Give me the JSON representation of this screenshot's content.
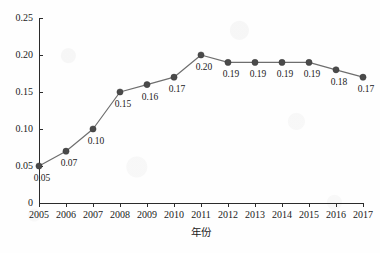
{
  "chart_data": {
    "type": "line",
    "title": "",
    "xlabel": "年份",
    "ylabel": "",
    "categories": [
      "2005",
      "2006",
      "2007",
      "2008",
      "2009",
      "2010",
      "2011",
      "2012",
      "2013",
      "2014",
      "2015",
      "2016",
      "2017"
    ],
    "values": [
      0.05,
      0.07,
      0.1,
      0.15,
      0.16,
      0.17,
      0.2,
      0.19,
      0.19,
      0.19,
      0.19,
      0.18,
      0.17
    ],
    "point_labels": [
      "0.05",
      "0.07",
      "0.10",
      "0.15",
      "0.16",
      "0.17",
      "0.20",
      "0.19",
      "0.19",
      "0.19",
      "0.19",
      "0.18",
      "0.17"
    ],
    "ylim": [
      0,
      0.25
    ],
    "yticks": [
      0,
      0.05,
      0.1,
      0.15,
      0.2,
      0.25
    ],
    "ytick_labels": [
      "0",
      "0.05",
      "0.10",
      "0.15",
      "0.20",
      "0.25"
    ],
    "xtick_labels": [
      "2005",
      "2006",
      "2007",
      "2008",
      "2009",
      "2010",
      "2011",
      "2012",
      "2013",
      "2014",
      "2015",
      "2016",
      "2017"
    ],
    "grid": false,
    "legend": "none",
    "series_color": "#6e6e6e",
    "marker_color": "#4a4a4a",
    "axis_color": "#2b2b2b",
    "background_color": "#fefefe"
  }
}
